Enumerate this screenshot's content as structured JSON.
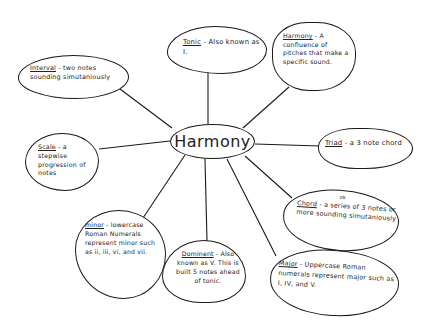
{
  "diagram": {
    "type": "concept-map",
    "style": "hand-drawn",
    "center": {
      "label": "Harmony"
    },
    "nodes": [
      {
        "id": "interval",
        "term": "Interval",
        "definition": " - two notes sounding simutaniously"
      },
      {
        "id": "tonic",
        "term": "Tonic",
        "definition": " - Also known as I."
      },
      {
        "id": "harmony",
        "term": "Harmony",
        "definition": " - A confluence of pitches that make a specific sound."
      },
      {
        "id": "scale",
        "term": "Scale",
        "definition": " - a stepwise progression of notes"
      },
      {
        "id": "triad",
        "term": "Triad",
        "definition": " - a 3 note chord"
      },
      {
        "id": "chord",
        "term": "Chord",
        "definition": " - a series of 3 notes or more sounding simutaniously",
        "annotation": "ok"
      },
      {
        "id": "minor",
        "term": "minor",
        "definition": " - lowercase Roman Numerals represent minor such as ii, iii, vi, and vii."
      },
      {
        "id": "dominent",
        "term": "Dominent",
        "definition": " - Also known as V. This is built 5 notes ahead of tonic."
      },
      {
        "id": "major",
        "term": "Major",
        "definition": " - Uppercase Roman numerals represent major such as I, IV, and V."
      }
    ]
  }
}
